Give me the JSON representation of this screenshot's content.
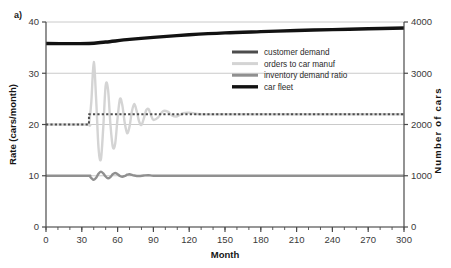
{
  "panel": {
    "label": "a)"
  },
  "chart_data": {
    "type": "line",
    "title": "",
    "xlabel": "Month",
    "ylabel": "Rate (cars/month)",
    "y2label": "Number of cars",
    "xlim": [
      0,
      300
    ],
    "ylim": [
      0,
      40
    ],
    "y2lim": [
      0,
      4000
    ],
    "xticks": [
      0,
      30,
      60,
      90,
      120,
      150,
      180,
      210,
      240,
      270,
      300
    ],
    "xticklabels": [
      "0",
      "30",
      "60",
      "90",
      "120",
      "150",
      "180",
      "210",
      "240",
      "270",
      "300"
    ],
    "xminortick_step": 10,
    "yticks": [
      0,
      10,
      20,
      30,
      40
    ],
    "yticklabels": [
      "0",
      "10",
      "20",
      "30",
      "40"
    ],
    "y2ticks": [
      0,
      1000,
      2000,
      3000,
      4000
    ],
    "y2ticklabels": [
      "0",
      "1000",
      "2000",
      "3000",
      "4000"
    ],
    "grid": "horizontal",
    "legend_position": "upper right",
    "series": [
      {
        "name": "customer demand",
        "axis": "left",
        "color": "#4d4d4d",
        "style": "dotted",
        "width": 2.0,
        "description": "Step from 20 to 22 cars/month at month 36, constant thereafter",
        "x": [
          0,
          36,
          36,
          300
        ],
        "y": [
          20,
          20,
          22,
          22
        ]
      },
      {
        "name": "orders to car manuf",
        "axis": "left",
        "color": "#d4d4d4",
        "style": "solid",
        "width": 2.4,
        "description": "Damped oscillation about 22 cars/month triggered at month 36, peak 32.2, settles to 22",
        "x": [
          0,
          34,
          36,
          38,
          40,
          42,
          44,
          46,
          48,
          50,
          52,
          54,
          56,
          58,
          60,
          62,
          64,
          66,
          68,
          70,
          72,
          74,
          76,
          78,
          80,
          82,
          84,
          86,
          88,
          90,
          94,
          98,
          102,
          106,
          110,
          115,
          120,
          130,
          150,
          200,
          250,
          300
        ],
        "y": [
          20,
          20,
          20.2,
          24.5,
          32.2,
          25.0,
          15.5,
          13.2,
          19.5,
          27.6,
          26.8,
          20.0,
          15.6,
          16.3,
          21.3,
          25.0,
          23.7,
          20.3,
          18.3,
          19.6,
          22.6,
          24.0,
          22.6,
          20.6,
          19.9,
          21.2,
          22.8,
          23.0,
          21.8,
          20.9,
          21.4,
          22.6,
          22.5,
          21.7,
          21.6,
          22.2,
          22.3,
          22.0,
          22.0,
          22.0,
          22.0,
          22.0
        ]
      },
      {
        "name": "inventory demand ratio",
        "axis": "left",
        "color": "#909090",
        "style": "solid",
        "width": 2.4,
        "description": "Constant 10 with small damped ripple between months 36 and 90",
        "x": [
          0,
          34,
          36,
          38,
          40,
          42,
          44,
          46,
          48,
          50,
          52,
          54,
          56,
          58,
          60,
          62,
          64,
          66,
          68,
          70,
          74,
          78,
          82,
          86,
          90,
          100,
          150,
          200,
          250,
          300
        ],
        "y": [
          10,
          10,
          10.0,
          9.55,
          9.2,
          9.6,
          10.4,
          10.8,
          10.45,
          9.85,
          9.5,
          9.75,
          10.3,
          10.55,
          10.3,
          9.95,
          9.8,
          9.95,
          10.2,
          10.3,
          10.05,
          9.95,
          10.05,
          10.1,
          10.0,
          10.0,
          10.0,
          10.0,
          10.0,
          10.0
        ]
      },
      {
        "name": "car fleet",
        "axis": "right",
        "color": "#121212",
        "style": "solid",
        "width": 3.4,
        "description": "Rises slowly from 3580 cars at month 0 to about 3880 cars at month 300",
        "x": [
          0,
          20,
          36,
          50,
          70,
          90,
          120,
          150,
          180,
          210,
          240,
          270,
          300
        ],
        "y": [
          3580,
          3578,
          3580,
          3610,
          3660,
          3700,
          3750,
          3788,
          3812,
          3834,
          3852,
          3868,
          3882
        ]
      }
    ]
  }
}
